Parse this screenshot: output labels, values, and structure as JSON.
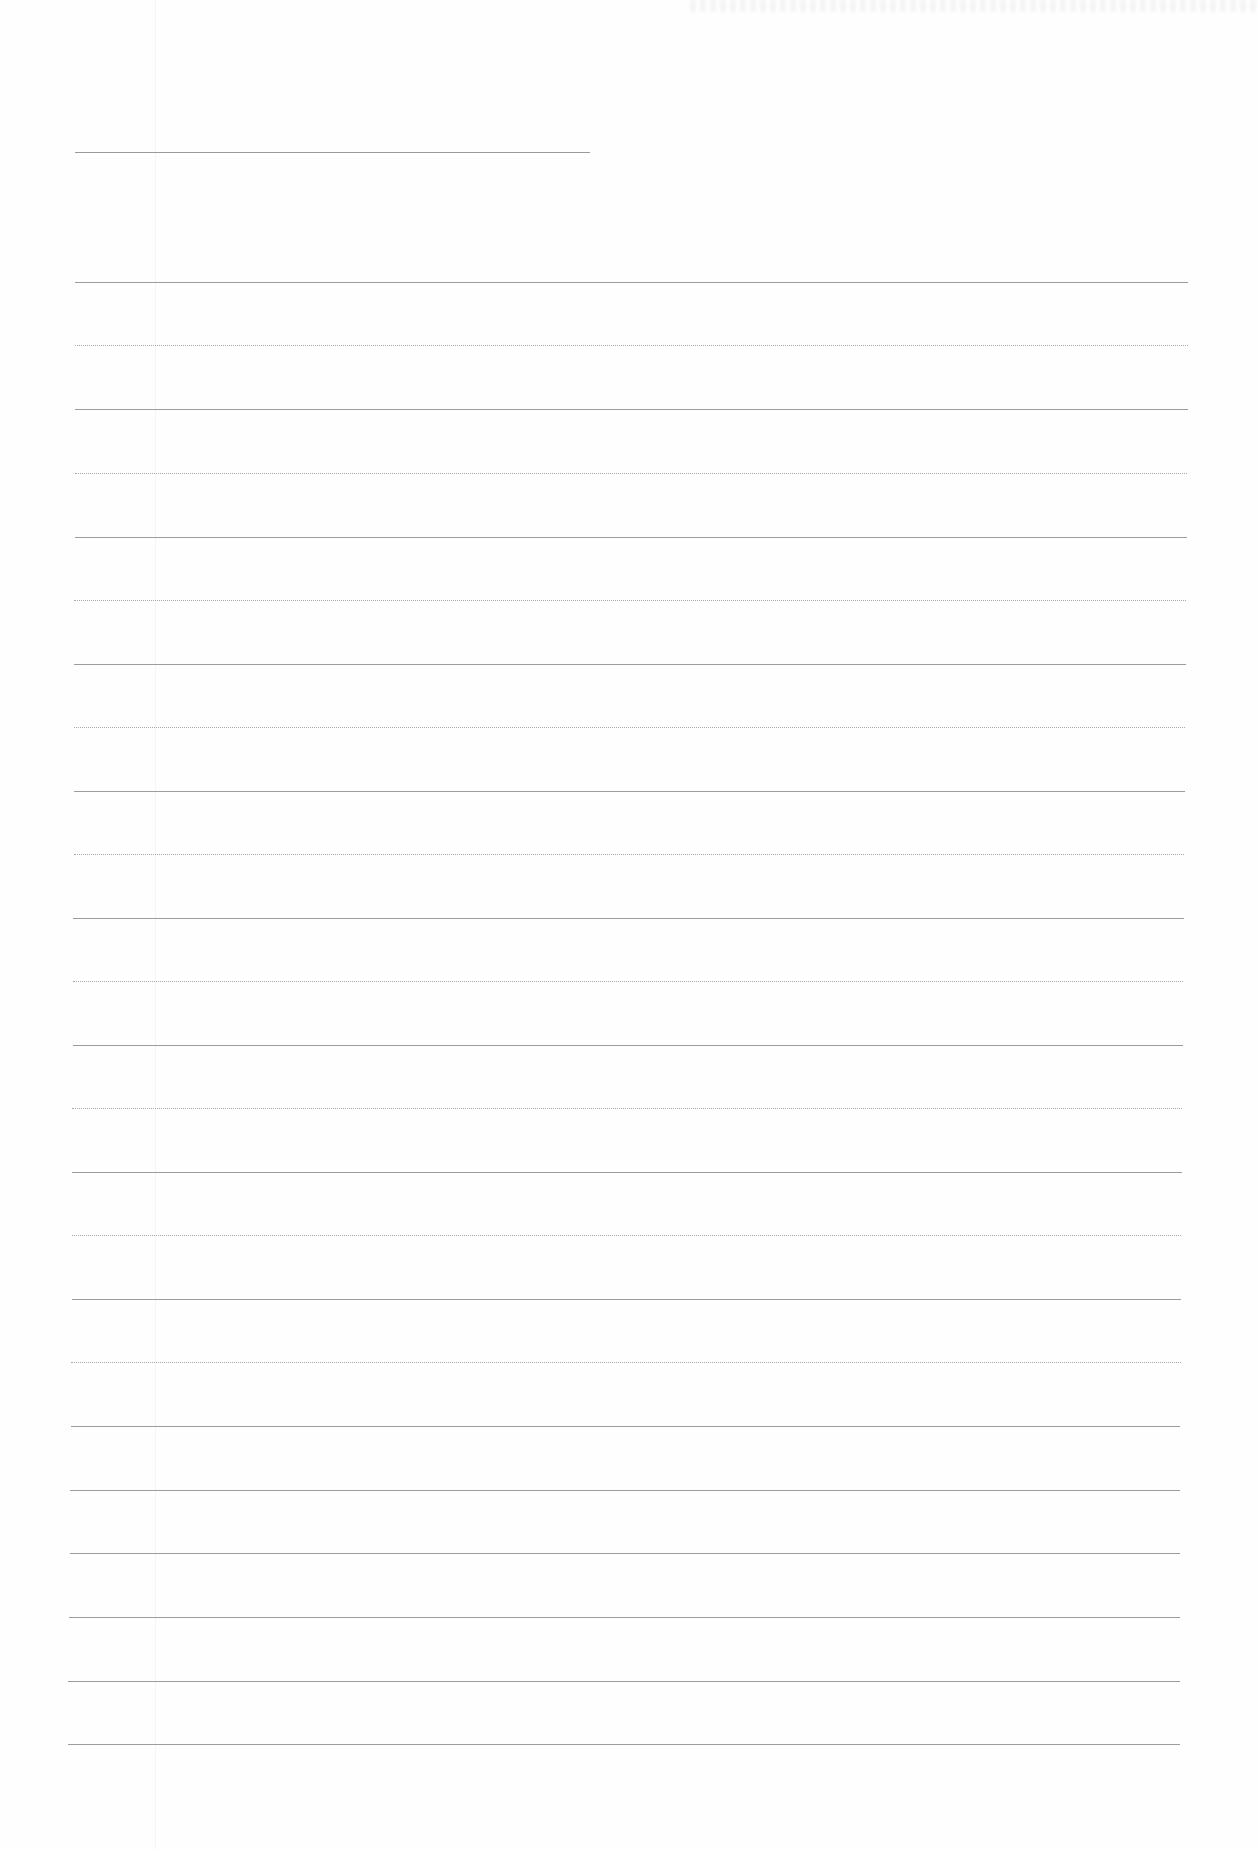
{
  "page": {
    "type": "blank ruled notebook paper",
    "text_content": "",
    "colors": {
      "paper": "#fefefe",
      "rule_solid": "#9c9c9c",
      "rule_dotted": "#a8a8a8"
    },
    "header_line": {
      "x1": 75,
      "x2": 590,
      "y": 152
    },
    "rules": [
      {
        "y": 282,
        "x1": 75,
        "x2": 1188,
        "style": "solid"
      },
      {
        "y": 345,
        "x1": 75,
        "x2": 1188,
        "style": "dotted"
      },
      {
        "y": 409,
        "x1": 75,
        "x2": 1188,
        "style": "solid"
      },
      {
        "y": 473,
        "x1": 75,
        "x2": 1187,
        "style": "dotted"
      },
      {
        "y": 537,
        "x1": 75,
        "x2": 1187,
        "style": "solid"
      },
      {
        "y": 600,
        "x1": 74,
        "x2": 1186,
        "style": "dotted"
      },
      {
        "y": 664,
        "x1": 74,
        "x2": 1186,
        "style": "solid"
      },
      {
        "y": 727,
        "x1": 74,
        "x2": 1185,
        "style": "dotted"
      },
      {
        "y": 791,
        "x1": 74,
        "x2": 1185,
        "style": "solid"
      },
      {
        "y": 854,
        "x1": 74,
        "x2": 1184,
        "style": "dotted"
      },
      {
        "y": 918,
        "x1": 73,
        "x2": 1184,
        "style": "solid"
      },
      {
        "y": 981,
        "x1": 73,
        "x2": 1183,
        "style": "dotted"
      },
      {
        "y": 1045,
        "x1": 73,
        "x2": 1183,
        "style": "solid"
      },
      {
        "y": 1108,
        "x1": 72,
        "x2": 1182,
        "style": "dotted"
      },
      {
        "y": 1172,
        "x1": 72,
        "x2": 1182,
        "style": "solid"
      },
      {
        "y": 1235,
        "x1": 72,
        "x2": 1181,
        "style": "dotted"
      },
      {
        "y": 1299,
        "x1": 72,
        "x2": 1181,
        "style": "solid"
      },
      {
        "y": 1362,
        "x1": 71,
        "x2": 1181,
        "style": "dotted"
      },
      {
        "y": 1426,
        "x1": 71,
        "x2": 1180,
        "style": "solid"
      },
      {
        "y": 1490,
        "x1": 70,
        "x2": 1180,
        "style": "solid"
      },
      {
        "y": 1553,
        "x1": 70,
        "x2": 1180,
        "style": "solid"
      },
      {
        "y": 1617,
        "x1": 69,
        "x2": 1180,
        "style": "solid"
      },
      {
        "y": 1681,
        "x1": 68,
        "x2": 1180,
        "style": "solid"
      },
      {
        "y": 1744,
        "x1": 68,
        "x2": 1180,
        "style": "solid"
      }
    ]
  }
}
